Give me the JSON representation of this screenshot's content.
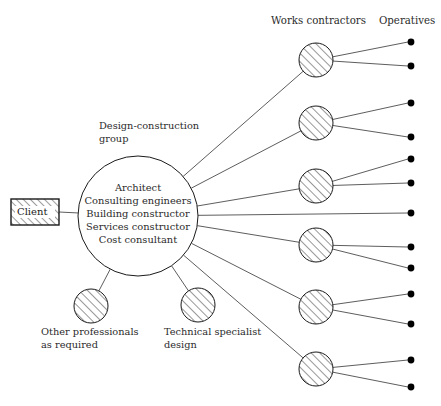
{
  "diagram": {
    "title_columns": [
      {
        "label": "Works contractors",
        "x": 271,
        "y": 15
      },
      {
        "label": "Operatives",
        "x": 379,
        "y": 15
      }
    ],
    "client": {
      "label": "Client",
      "box": {
        "x": 11,
        "y": 199,
        "w": 48,
        "h": 26
      },
      "fill_pattern": "hatch-45"
    },
    "design_group": {
      "caption_line1": "Design-construction",
      "caption_line2": "group",
      "caption_x": 99,
      "caption_y": 120,
      "circle": {
        "cx": 138,
        "cy": 216,
        "r": 60
      },
      "members": [
        "Architect",
        "Consulting engineers",
        "Building constructor",
        "Services constructor",
        "Cost consultant"
      ]
    },
    "satellites": [
      {
        "name": "other-professionals",
        "circle": {
          "cx": 91,
          "cy": 306,
          "r": 17
        },
        "caption_line1": "Other professionals",
        "caption_line2": "as required",
        "caption_x": 41,
        "caption_y": 326
      },
      {
        "name": "technical-specialist",
        "circle": {
          "cx": 198,
          "cy": 305,
          "r": 17
        },
        "caption_line1": "Technical specialist",
        "caption_line2": "design",
        "caption_x": 164,
        "caption_y": 326
      }
    ],
    "works_contractors": [
      {
        "cx": 316,
        "cy": 60,
        "r": 17
      },
      {
        "cx": 316,
        "cy": 123,
        "r": 17
      },
      {
        "cx": 316,
        "cy": 186,
        "r": 17
      },
      {
        "cx": 316,
        "cy": 245,
        "r": 17
      },
      {
        "cx": 316,
        "cy": 307,
        "r": 17
      },
      {
        "cx": 316,
        "cy": 369,
        "r": 17
      }
    ],
    "operatives": [
      {
        "cx": 411,
        "cy": 42
      },
      {
        "cx": 411,
        "cy": 66
      },
      {
        "cx": 411,
        "cy": 103
      },
      {
        "cx": 411,
        "cy": 137
      },
      {
        "cx": 411,
        "cy": 159
      },
      {
        "cx": 411,
        "cy": 183
      },
      {
        "cx": 411,
        "cy": 213
      },
      {
        "cx": 411,
        "cy": 247
      },
      {
        "cx": 411,
        "cy": 268
      },
      {
        "cx": 411,
        "cy": 294
      },
      {
        "cx": 411,
        "cy": 324
      },
      {
        "cx": 411,
        "cy": 360
      },
      {
        "cx": 411,
        "cy": 387
      }
    ],
    "colors": {
      "stroke": "#1a1a1a",
      "line": "#333333",
      "text": "#2b2b2b",
      "background": "#ffffff",
      "dot": "#000000"
    }
  }
}
